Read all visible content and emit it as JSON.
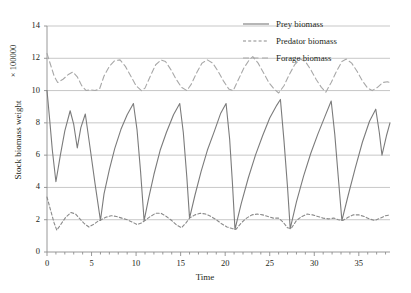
{
  "chart_data": {
    "type": "line",
    "title": "",
    "xlabel": "Time",
    "ylabel": "Stock biomass weight",
    "y_multiplier": "× 100000",
    "xlim": [
      0,
      38.5
    ],
    "ylim": [
      0,
      14
    ],
    "xticks": [
      0,
      5,
      10,
      15,
      20,
      25,
      30,
      35
    ],
    "xtick_labels": [
      "0",
      "5",
      "10",
      "15",
      "20",
      "25",
      "30",
      "35"
    ],
    "x_minor_tick_step": 1,
    "yticks": [
      0,
      2,
      4,
      6,
      8,
      10,
      12,
      14
    ],
    "ytick_labels": [
      "0",
      "2",
      "4",
      "6",
      "8",
      "10",
      "12",
      "14"
    ],
    "grid": "horizontal",
    "legend_position": "top-right",
    "series": [
      {
        "name": "Prey biomass",
        "style": "solid",
        "color": "#7b7b7b",
        "points": [
          [
            0.0,
            10.0
          ],
          [
            0.3,
            8.2
          ],
          [
            0.6,
            6.3
          ],
          [
            1.0,
            4.35
          ],
          [
            1.5,
            6.0
          ],
          [
            2.0,
            7.5
          ],
          [
            2.6,
            8.75
          ],
          [
            3.0,
            7.9
          ],
          [
            3.4,
            6.45
          ],
          [
            3.8,
            7.7
          ],
          [
            4.3,
            8.55
          ],
          [
            4.8,
            6.6
          ],
          [
            5.4,
            4.2
          ],
          [
            6.0,
            1.95
          ],
          [
            6.4,
            3.6
          ],
          [
            7.0,
            5.1
          ],
          [
            7.6,
            6.4
          ],
          [
            8.3,
            7.6
          ],
          [
            9.0,
            8.5
          ],
          [
            9.7,
            9.2
          ],
          [
            10.1,
            7.6
          ],
          [
            10.5,
            5.0
          ],
          [
            10.9,
            1.95
          ],
          [
            11.4,
            3.3
          ],
          [
            12.0,
            4.8
          ],
          [
            12.7,
            6.3
          ],
          [
            13.4,
            7.4
          ],
          [
            14.2,
            8.5
          ],
          [
            14.9,
            9.2
          ],
          [
            15.3,
            7.4
          ],
          [
            15.7,
            4.6
          ],
          [
            16.0,
            2.1
          ],
          [
            16.6,
            3.5
          ],
          [
            17.3,
            5.0
          ],
          [
            18.0,
            6.3
          ],
          [
            18.8,
            7.5
          ],
          [
            19.5,
            8.6
          ],
          [
            20.1,
            9.2
          ],
          [
            20.5,
            7.0
          ],
          [
            20.8,
            4.4
          ],
          [
            21.1,
            1.4
          ],
          [
            21.8,
            3.0
          ],
          [
            22.6,
            4.6
          ],
          [
            23.4,
            6.0
          ],
          [
            24.2,
            7.2
          ],
          [
            25.0,
            8.3
          ],
          [
            25.8,
            9.1
          ],
          [
            26.2,
            9.45
          ],
          [
            26.6,
            6.9
          ],
          [
            27.0,
            4.0
          ],
          [
            27.3,
            1.45
          ],
          [
            28.0,
            3.1
          ],
          [
            28.8,
            4.7
          ],
          [
            29.6,
            6.1
          ],
          [
            30.4,
            7.3
          ],
          [
            31.2,
            8.4
          ],
          [
            31.9,
            9.35
          ],
          [
            32.3,
            7.3
          ],
          [
            32.7,
            4.6
          ],
          [
            33.1,
            1.95
          ],
          [
            33.8,
            3.5
          ],
          [
            34.6,
            5.2
          ],
          [
            35.4,
            6.8
          ],
          [
            36.2,
            8.1
          ],
          [
            36.9,
            8.85
          ],
          [
            37.3,
            7.4
          ],
          [
            37.6,
            6.0
          ],
          [
            38.1,
            7.2
          ],
          [
            38.5,
            8.0
          ]
        ]
      },
      {
        "name": "Predator biomass",
        "style": "dotted",
        "color": "#8a8a8a",
        "points": [
          [
            0.0,
            3.4
          ],
          [
            0.4,
            2.6
          ],
          [
            0.8,
            1.8
          ],
          [
            1.1,
            1.35
          ],
          [
            1.6,
            1.75
          ],
          [
            2.1,
            2.15
          ],
          [
            2.7,
            2.45
          ],
          [
            3.2,
            2.35
          ],
          [
            3.7,
            2.05
          ],
          [
            4.2,
            1.75
          ],
          [
            4.7,
            1.55
          ],
          [
            5.2,
            1.7
          ],
          [
            5.7,
            1.9
          ],
          [
            6.1,
            2.0
          ],
          [
            6.6,
            2.15
          ],
          [
            7.2,
            2.25
          ],
          [
            7.8,
            2.2
          ],
          [
            8.4,
            2.1
          ],
          [
            9.0,
            2.0
          ],
          [
            9.6,
            1.85
          ],
          [
            10.1,
            1.7
          ],
          [
            10.6,
            1.8
          ],
          [
            11.0,
            1.95
          ],
          [
            11.6,
            2.2
          ],
          [
            12.2,
            2.4
          ],
          [
            12.8,
            2.4
          ],
          [
            13.4,
            2.2
          ],
          [
            14.0,
            1.95
          ],
          [
            14.6,
            1.65
          ],
          [
            15.1,
            1.5
          ],
          [
            15.6,
            1.8
          ],
          [
            16.0,
            2.1
          ],
          [
            16.6,
            2.3
          ],
          [
            17.2,
            2.4
          ],
          [
            17.8,
            2.35
          ],
          [
            18.4,
            2.2
          ],
          [
            19.0,
            2.0
          ],
          [
            19.6,
            1.75
          ],
          [
            20.2,
            1.55
          ],
          [
            20.8,
            1.45
          ],
          [
            21.2,
            1.4
          ],
          [
            21.8,
            1.8
          ],
          [
            22.4,
            2.1
          ],
          [
            23.0,
            2.3
          ],
          [
            23.6,
            2.35
          ],
          [
            24.2,
            2.3
          ],
          [
            24.8,
            2.2
          ],
          [
            25.4,
            2.1
          ],
          [
            26.0,
            2.1
          ],
          [
            26.5,
            1.85
          ],
          [
            27.0,
            1.5
          ],
          [
            27.4,
            1.45
          ],
          [
            28.0,
            1.95
          ],
          [
            28.6,
            2.2
          ],
          [
            29.2,
            2.35
          ],
          [
            29.8,
            2.3
          ],
          [
            30.4,
            2.2
          ],
          [
            31.0,
            2.1
          ],
          [
            31.6,
            2.05
          ],
          [
            32.2,
            2.1
          ],
          [
            32.7,
            2.0
          ],
          [
            33.2,
            1.95
          ],
          [
            33.8,
            2.15
          ],
          [
            34.4,
            2.3
          ],
          [
            35.0,
            2.3
          ],
          [
            35.6,
            2.2
          ],
          [
            36.2,
            2.05
          ],
          [
            36.8,
            1.95
          ],
          [
            37.4,
            2.1
          ],
          [
            38.0,
            2.25
          ],
          [
            38.5,
            2.3
          ]
        ]
      },
      {
        "name": "Forage biomass",
        "style": "dashed",
        "color": "#a8a8a8",
        "points": [
          [
            0.0,
            12.3
          ],
          [
            0.4,
            11.6
          ],
          [
            0.8,
            10.9
          ],
          [
            1.2,
            10.5
          ],
          [
            1.8,
            10.7
          ],
          [
            2.4,
            11.0
          ],
          [
            2.9,
            11.15
          ],
          [
            3.4,
            10.85
          ],
          [
            3.9,
            10.3
          ],
          [
            4.4,
            10.0
          ],
          [
            4.9,
            10.05
          ],
          [
            5.4,
            10.0
          ],
          [
            5.9,
            10.1
          ],
          [
            6.4,
            10.9
          ],
          [
            7.0,
            11.5
          ],
          [
            7.6,
            11.85
          ],
          [
            8.2,
            11.9
          ],
          [
            8.8,
            11.5
          ],
          [
            9.4,
            10.9
          ],
          [
            10.0,
            10.3
          ],
          [
            10.6,
            10.0
          ],
          [
            11.0,
            10.15
          ],
          [
            11.6,
            10.9
          ],
          [
            12.2,
            11.6
          ],
          [
            12.8,
            11.9
          ],
          [
            13.3,
            11.8
          ],
          [
            13.9,
            11.3
          ],
          [
            14.5,
            10.7
          ],
          [
            15.1,
            10.2
          ],
          [
            15.7,
            10.0
          ],
          [
            16.2,
            10.4
          ],
          [
            16.8,
            11.1
          ],
          [
            17.4,
            11.7
          ],
          [
            18.0,
            11.9
          ],
          [
            18.6,
            11.7
          ],
          [
            19.2,
            11.2
          ],
          [
            19.8,
            10.6
          ],
          [
            20.4,
            10.1
          ],
          [
            20.9,
            10.0
          ],
          [
            21.5,
            10.7
          ],
          [
            22.1,
            11.4
          ],
          [
            22.7,
            11.9
          ],
          [
            23.1,
            12.1
          ],
          [
            23.7,
            11.7
          ],
          [
            24.3,
            11.1
          ],
          [
            24.9,
            10.5
          ],
          [
            25.5,
            10.1
          ],
          [
            26.0,
            9.85
          ],
          [
            26.6,
            10.3
          ],
          [
            27.2,
            11.0
          ],
          [
            27.8,
            11.6
          ],
          [
            28.4,
            11.95
          ],
          [
            29.0,
            11.8
          ],
          [
            29.6,
            11.3
          ],
          [
            30.2,
            10.7
          ],
          [
            30.8,
            10.2
          ],
          [
            31.3,
            9.9
          ],
          [
            31.9,
            10.5
          ],
          [
            32.5,
            11.2
          ],
          [
            33.1,
            11.8
          ],
          [
            33.6,
            11.95
          ],
          [
            34.2,
            11.7
          ],
          [
            34.8,
            11.2
          ],
          [
            35.4,
            10.6
          ],
          [
            36.0,
            10.15
          ],
          [
            36.5,
            10.0
          ],
          [
            37.1,
            10.2
          ],
          [
            37.7,
            10.5
          ],
          [
            38.2,
            10.55
          ],
          [
            38.5,
            10.5
          ]
        ]
      }
    ]
  },
  "legend": {
    "items": [
      {
        "label": "Prey biomass",
        "style": "solid"
      },
      {
        "label": "Predator biomass",
        "style": "dotted"
      },
      {
        "label": "Forage biomass",
        "style": "dashed"
      }
    ]
  },
  "colors": {
    "background": "#ffffff",
    "grid": "#b9b9b9",
    "axis": "#8d8d8d",
    "text": "#231f20"
  }
}
